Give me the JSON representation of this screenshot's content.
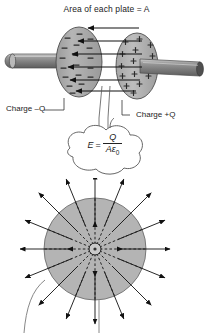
{
  "figure": {
    "title": "Area of each plate = A",
    "background_color": "#ffffff",
    "ink_color": "#1a1a1a",
    "plate_fill": "#a8a8a8",
    "rod_fill": "#8f8f8f",
    "sphere_fill": "#b3b3b3"
  },
  "capacitor": {
    "title_label": "Area of each plate = A",
    "area_symbol": "A",
    "left_plate": {
      "label": "Charge –Q",
      "charge_sign": "–",
      "charge_symbol": "Q",
      "sign_glyph": "–",
      "sign_count": 18
    },
    "right_plate": {
      "label": "Charge +Q",
      "charge_sign": "+",
      "charge_symbol": "Q",
      "sign_glyph": "+",
      "sign_count": 14
    },
    "field_arrows": {
      "count": 6,
      "direction": "right-to-left",
      "description": "electric field arrows from positive plate to negative plate"
    },
    "rods": {
      "left_rod": "terminal-rod-left",
      "right_rod": "terminal-rod-right"
    }
  },
  "equation_callout": {
    "lhs": "E",
    "equals": "=",
    "numerator": "Q",
    "denominator_area": "A",
    "denominator_epsilon": "ε",
    "denominator_subscript": "0",
    "full_text": "E = Q / Aε0"
  },
  "sphere_diagram": {
    "ray_count": 16,
    "center_charge": "point charge",
    "field_direction": "radially outward",
    "leader_lines": 2
  },
  "icons": {
    "minus": "minus-sign-icon",
    "plus": "plus-sign-icon",
    "arrow": "arrow-icon"
  }
}
